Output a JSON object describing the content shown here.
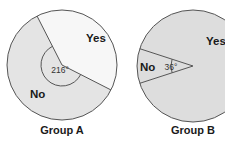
{
  "chart_data": [
    {
      "type": "pie",
      "title": "Group A",
      "categories": [
        "Yes",
        "No"
      ],
      "values": [
        40,
        60
      ],
      "angles_deg": [
        144,
        216
      ],
      "annotations": [
        {
          "text": "216°",
          "target": "No",
          "kind": "angle-arc"
        }
      ],
      "colors": {
        "Yes": "#f7f7f7",
        "No": "#e4e4e4"
      },
      "center": [
        62,
        65
      ],
      "radius": 55,
      "no_start_screen_deg": 27,
      "label_positions": {
        "Yes": [
          86,
          42
        ],
        "No": [
          30,
          98
        ]
      }
    },
    {
      "type": "pie",
      "title": "Group B",
      "categories": [
        "Yes",
        "No"
      ],
      "values": [
        90,
        10
      ],
      "angles_deg": [
        324,
        36
      ],
      "annotations": [
        {
          "text": "36°",
          "target": "No",
          "kind": "angle-arc"
        }
      ],
      "colors": {
        "Yes": "#dddddd",
        "No": "#dddddd"
      },
      "center": [
        193,
        66
      ],
      "radius": 56,
      "no_start_screen_deg": 162,
      "label_positions": {
        "Yes": [
          206,
          45
        ],
        "No": [
          140,
          71
        ]
      }
    }
  ],
  "captions": {
    "group_a": "Group A",
    "group_b": "Group B"
  },
  "stroke_color": "#555555",
  "label_color": "#1a1a1a"
}
